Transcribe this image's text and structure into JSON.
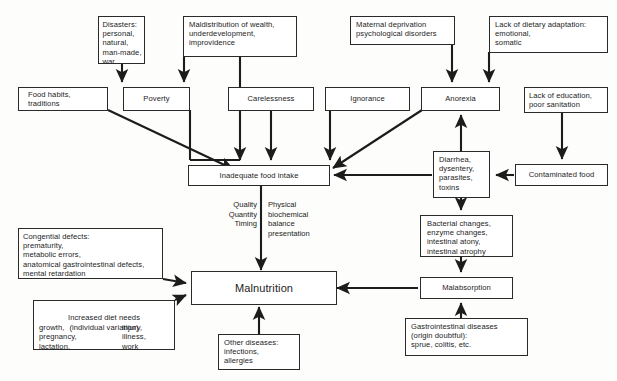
{
  "diagram": {
    "type": "flowchart",
    "stroke_color": "#2a2a2a",
    "background_color": "#fdfdfb",
    "text_color": "#1c1c1c",
    "nodes": {
      "disasters": "Disasters:\npersonal,\nnatural,\nman-made,\nwar",
      "maldistribution": "Maldistribution of wealth,\nunderdevelopment,\nimprovidence",
      "maternal_deprivation": "Maternal deprivation\npsychological disorders",
      "dietary_adaptation": "Lack of dietary adaptation:\nemotional,\nsomatic",
      "food_habits": "Food habits,\ntraditions",
      "poverty": "Poverty",
      "carelessness": "Carelessness",
      "ignorance": "Ignorance",
      "anorexia": "Anorexia",
      "education": "Lack of education,\npoor sanitation",
      "inadequate_intake": "Inadequate food intake",
      "diarrhea": "Diarrhea,\ndysentery,\nparasites,\ntoxins",
      "contaminated_food": "Contaminated food",
      "bacterial_changes": "Bacterial changes,\nenzyme changes,\nintestinal atony,\nintestinal atrophy",
      "malabsorption": "Malabsorption",
      "congenital_defects": "Congential defects:\nprematurity,\nmetabolic errors,\nanatomical gastrointestinal defects,\nmental retardation",
      "increased_diet_title": "Increased diet needs\n(individual variation)",
      "increased_diet_col_left": "growth,\npregnancy,\nlactation,",
      "increased_diet_col_right": "injury,\nillness,\nwork",
      "malnutrition": "Malnutrition",
      "other_diseases": "Other diseases:\ninfections,\nallergies",
      "gi_diseases": "Gastrointestinal diseases\n(origin doubtful):\nsprue, colitis, etc."
    },
    "edge_labels": {
      "quality_quantity_timing": "Quality\nQuantity\nTiming",
      "physical_biochemical": "Physical\nbiochemical\nbalance\npresentation"
    }
  }
}
